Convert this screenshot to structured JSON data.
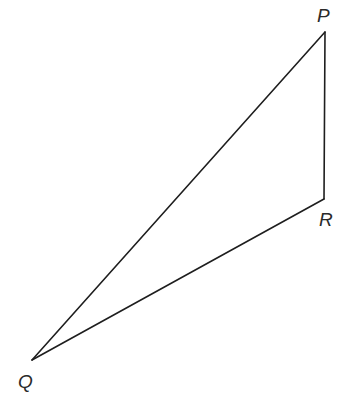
{
  "diagram": {
    "type": "triangle",
    "vertices": [
      {
        "id": "P",
        "label": "P",
        "x": 325,
        "y": 32,
        "label_x": 317,
        "label_y": 22
      },
      {
        "id": "R",
        "label": "R",
        "x": 324,
        "y": 199,
        "label_x": 319,
        "label_y": 226
      },
      {
        "id": "Q",
        "label": "Q",
        "x": 32,
        "y": 360,
        "label_x": 18,
        "label_y": 388
      }
    ],
    "edges": [
      {
        "from": "P",
        "to": "R"
      },
      {
        "from": "R",
        "to": "Q"
      },
      {
        "from": "Q",
        "to": "P"
      }
    ],
    "colors": {
      "line": "#1e1e1e",
      "label": "#2a2a2a",
      "background": "#ffffff"
    }
  }
}
